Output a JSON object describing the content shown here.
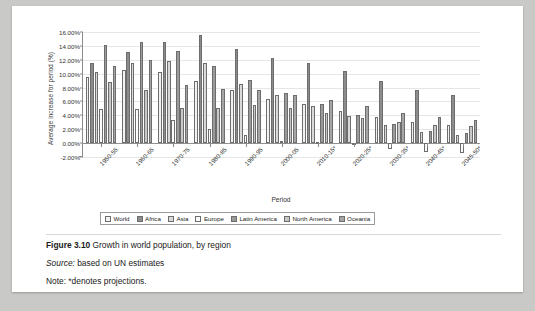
{
  "figure": {
    "number_label": "Figure 3.10",
    "title": "Growth in world population, by region",
    "source_label": "Source:",
    "source_text": "based on UN estimates",
    "note_label": "Note:",
    "note_text": "*denotes projections."
  },
  "chart_data": {
    "type": "bar",
    "title": "",
    "xlabel": "Period",
    "ylabel": "Average increase for period (%)",
    "ylim": [
      -2,
      16
    ],
    "ytick_step": 2,
    "ytick_labels": [
      "16.00%",
      "14.00%",
      "12.00%",
      "10.00%",
      "8.00%",
      "6.00%",
      "4.00%",
      "2.00%",
      "0.00%",
      "-2.00%"
    ],
    "grid": true,
    "legend_position": "bottom",
    "categories": [
      "1950-55",
      "1960-65",
      "1970-75",
      "1980-85",
      "1990-95",
      "2000-05",
      "2010-15*",
      "2020-25*",
      "2030-35*",
      "2040-45*",
      "2045-50*"
    ],
    "series": [
      {
        "name": "World",
        "color": "#f2f2f2",
        "values": [
          9.5,
          10.5,
          10.3,
          8.9,
          7.7,
          6.4,
          5.6,
          4.6,
          3.7,
          3.0,
          2.6
        ]
      },
      {
        "name": "Africa",
        "color": "#8c8c8c",
        "values": [
          11.5,
          13.1,
          14.5,
          15.5,
          13.6,
          12.3,
          11.5,
          10.4,
          9.0,
          7.7,
          6.9
        ]
      },
      {
        "name": "Asia",
        "color": "#d9d9d9",
        "values": [
          10.2,
          11.5,
          11.8,
          11.5,
          8.5,
          6.9,
          5.4,
          3.9,
          2.6,
          1.6,
          1.2
        ]
      },
      {
        "name": "Europe",
        "color": "#fbfbfb",
        "values": [
          4.9,
          4.9,
          3.3,
          2.0,
          1.1,
          0.3,
          0.2,
          -0.3,
          -0.9,
          -1.3,
          -1.4
        ]
      },
      {
        "name": "Latin America",
        "color": "#9a9a9a",
        "values": [
          14.2,
          14.6,
          13.3,
          11.1,
          9.1,
          7.2,
          5.6,
          4.1,
          2.8,
          1.8,
          1.4
        ]
      },
      {
        "name": "North America",
        "color": "#c8c8c8",
        "values": [
          8.8,
          7.6,
          5.0,
          5.1,
          5.5,
          5.1,
          4.3,
          3.6,
          3.0,
          2.6,
          2.4
        ]
      },
      {
        "name": "Oceania",
        "color": "#a5a5a5",
        "values": [
          11.1,
          11.9,
          8.3,
          7.8,
          7.6,
          6.9,
          6.2,
          5.3,
          4.4,
          3.8,
          3.4
        ]
      }
    ]
  }
}
